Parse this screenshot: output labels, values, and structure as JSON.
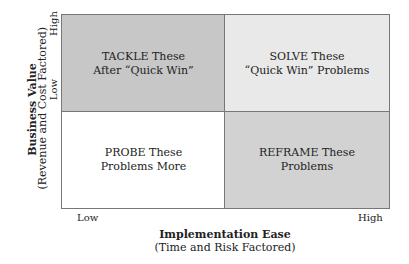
{
  "quadrants": {
    "top_left": {
      "label": "TACKLE These\nAfter “Quick Win”",
      "color": "#c7c7c7"
    },
    "top_right": {
      "label": "SOLVE These\n“Quick Win” Problems",
      "color": "#e9e9e9"
    },
    "bottom_left": {
      "label": "PROBE These\nProblems More",
      "color": "#ffffff"
    },
    "bottom_right": {
      "label": "REFRAME These\nProblems",
      "color": "#d2d2d2"
    }
  },
  "y_axis": {
    "title": "Business Value",
    "subtitle": "(Revenue and Cost Factored)",
    "high": "High",
    "low": "Low"
  },
  "x_axis": {
    "title": "Implementation Ease",
    "subtitle": "(Time and Risk Factored)",
    "low": "Low",
    "high": "High"
  }
}
